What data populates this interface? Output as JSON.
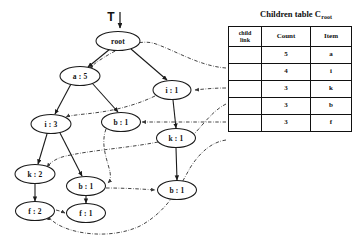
{
  "figure": {
    "tree_pointer_label": "T",
    "pointer_icon": "down-arrow-icon"
  },
  "table": {
    "title_main": "Children table C",
    "title_subscript": "root",
    "headers": {
      "child_link": "child link",
      "child_link_line1": "child",
      "child_link_line2": "link",
      "count": "Count",
      "item": "Item"
    },
    "rows": [
      {
        "child_link": "",
        "count": "5",
        "item": "a"
      },
      {
        "child_link": "",
        "count": "4",
        "item": "i"
      },
      {
        "child_link": "",
        "count": "3",
        "item": "k"
      },
      {
        "child_link": "",
        "count": "3",
        "item": "b"
      },
      {
        "child_link": "",
        "count": "3",
        "item": "f"
      }
    ]
  },
  "tree": {
    "nodes": [
      {
        "id": "root",
        "label": "root",
        "cx": 118,
        "cy": 41,
        "rx": 22,
        "ry": 9.5
      },
      {
        "id": "a5",
        "label": "a : 5",
        "cx": 80,
        "cy": 76,
        "rx": 20,
        "ry": 9.5
      },
      {
        "id": "i1",
        "label": "i : 1",
        "cx": 172,
        "cy": 90,
        "rx": 19,
        "ry": 9.5
      },
      {
        "id": "i3",
        "label": "i : 3",
        "cx": 51,
        "cy": 124,
        "rx": 20,
        "ry": 9.5
      },
      {
        "id": "b1m",
        "label": "b : 1",
        "cx": 121,
        "cy": 122,
        "rx": 19.5,
        "ry": 9.5
      },
      {
        "id": "k1",
        "label": "k : 1",
        "cx": 176,
        "cy": 138,
        "rx": 19.5,
        "ry": 9.5
      },
      {
        "id": "k2",
        "label": "k : 2",
        "cx": 35,
        "cy": 174,
        "rx": 20,
        "ry": 9.5
      },
      {
        "id": "b1l",
        "label": "b : 1",
        "cx": 86,
        "cy": 186,
        "rx": 19.5,
        "ry": 9.5
      },
      {
        "id": "b1r",
        "label": "b : 1",
        "cx": 177,
        "cy": 190,
        "rx": 19.5,
        "ry": 9.5
      },
      {
        "id": "f2",
        "label": "f : 2",
        "cx": 35,
        "cy": 211,
        "rx": 19.5,
        "ry": 9.5
      },
      {
        "id": "f1",
        "label": "f : 1",
        "cx": 86,
        "cy": 213,
        "rx": 19.5,
        "ry": 9.5
      }
    ],
    "edges": [
      {
        "from": "root",
        "to": "a5"
      },
      {
        "from": "root",
        "to": "i1"
      },
      {
        "from": "a5",
        "to": "i3"
      },
      {
        "from": "a5",
        "to": "b1m"
      },
      {
        "from": "i1",
        "to": "k1"
      },
      {
        "from": "i3",
        "to": "k2"
      },
      {
        "from": "i3",
        "to": "b1l"
      },
      {
        "from": "k1",
        "to": "b1r"
      },
      {
        "from": "k2",
        "to": "f2"
      },
      {
        "from": "b1l",
        "to": "f1"
      }
    ]
  }
}
